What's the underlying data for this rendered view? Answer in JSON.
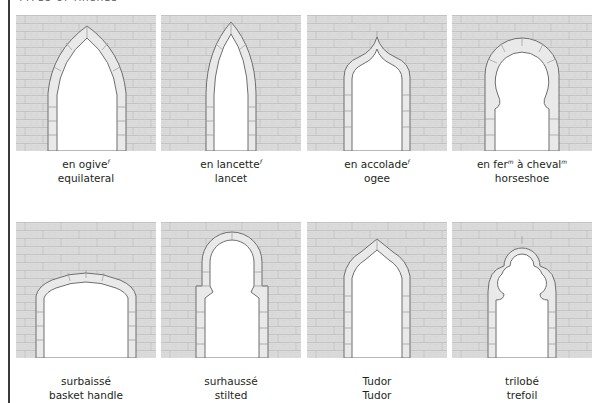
{
  "header": {
    "title": "TYPES OF ARCHES"
  },
  "colors": {
    "wall": "#dcdcdc",
    "mortar": "#bdbdbd",
    "voussoir": "#e9e9e9",
    "outline": "#6e6e6e",
    "opening": "#ffffff",
    "frame": "#3a3a3a"
  },
  "arches": [
    {
      "id": "equilateral",
      "french": "en ogive",
      "french_gender": "f",
      "french_extra": "",
      "french_extra_gender": "",
      "english": "equilateral"
    },
    {
      "id": "lancet",
      "french": "en lancette",
      "french_gender": "f",
      "french_extra": "",
      "french_extra_gender": "",
      "english": "lancet"
    },
    {
      "id": "ogee",
      "french": "en accolade",
      "french_gender": "f",
      "french_extra": "",
      "french_extra_gender": "",
      "english": "ogee"
    },
    {
      "id": "horseshoe",
      "french": "en fer",
      "french_gender": "m",
      "french_extra": " à cheval",
      "french_extra_gender": "m",
      "english": "horseshoe"
    },
    {
      "id": "basket-handle",
      "french": "surbaissé",
      "french_gender": "",
      "french_extra": "",
      "french_extra_gender": "",
      "english": "basket handle"
    },
    {
      "id": "stilted",
      "french": "surhaussé",
      "french_gender": "",
      "french_extra": "",
      "french_extra_gender": "",
      "english": "stilted"
    },
    {
      "id": "tudor",
      "french": "Tudor",
      "french_gender": "",
      "french_extra": "",
      "french_extra_gender": "",
      "english": "Tudor"
    },
    {
      "id": "trefoil",
      "french": "trilobé",
      "french_gender": "",
      "french_extra": "",
      "french_extra_gender": "",
      "english": "trefoil"
    }
  ]
}
